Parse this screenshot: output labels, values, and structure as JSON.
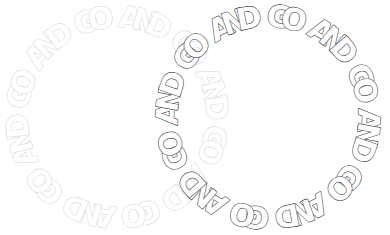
{
  "canvas": {
    "width": 390,
    "height": 235,
    "background": "#ffffff",
    "description": "Two overlapping circular text rings of repeating bubble-outline letters"
  },
  "rings": [
    {
      "id": "left-ring",
      "name": "circular-text-ring-left",
      "phrase": "GO AND ",
      "text": "GO AND GO AND GO AND GO AND GO AND GO AND ",
      "letters": [
        "G",
        "O",
        " ",
        "A",
        "N",
        "D",
        " ",
        "G",
        "O",
        " ",
        "A",
        "N",
        "D",
        " ",
        "G",
        "O",
        " ",
        "A",
        "N",
        "D",
        " ",
        "G",
        "O",
        " ",
        "A",
        "N",
        "D",
        " ",
        "G",
        "O",
        " ",
        "A",
        "N",
        "D",
        " ",
        "G",
        "O",
        " ",
        "A",
        "N",
        "D",
        " "
      ],
      "center_x": 117,
      "center_y": 117,
      "radius": 100,
      "start_angle": -108,
      "stroke_color": "#d8d8dc",
      "fill_color": "#ffffff",
      "stroke_width": 1.15,
      "font_size": 30,
      "repeats": 6
    },
    {
      "id": "right-ring",
      "name": "circular-text-ring-right",
      "phrase": "AND GO ",
      "text": "AND GO AND GO AND GO AND GO AND GO AND GO ",
      "letters": [
        "A",
        "N",
        "D",
        " ",
        "G",
        "O",
        " ",
        "A",
        "N",
        "D",
        " ",
        "G",
        "O",
        " ",
        "A",
        "N",
        "D",
        " ",
        "G",
        "O",
        " ",
        "A",
        "N",
        "D",
        " ",
        "G",
        "O",
        " ",
        "A",
        "N",
        "D",
        " ",
        "G",
        "O",
        " ",
        "A",
        "N",
        "D",
        " ",
        "G",
        "O",
        " "
      ],
      "center_x": 268,
      "center_y": 117,
      "radius": 101,
      "start_angle": -118,
      "stroke_color": "#4a4a52",
      "fill_color": "#ffffff",
      "stroke_width": 1.25,
      "font_size": 30,
      "repeats": 6
    }
  ]
}
